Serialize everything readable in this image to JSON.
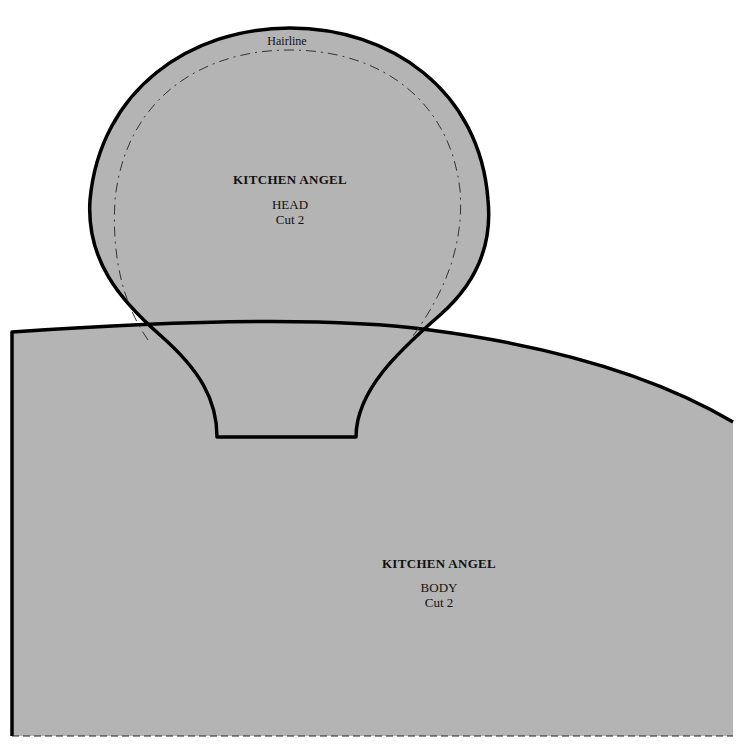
{
  "colors": {
    "fabric_fill": "#b4b4b4",
    "outline": "#000000",
    "background": "#ffffff"
  },
  "head_piece": {
    "title": "KITCHEN ANGEL",
    "part": "HEAD",
    "cut": "Cut 2",
    "hairline_label": "Hairline"
  },
  "body_piece": {
    "title": "KITCHEN ANGEL",
    "part": "BODY",
    "cut": "Cut 2"
  }
}
